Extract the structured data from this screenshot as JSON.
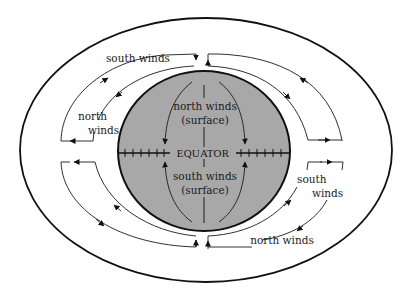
{
  "diagram": {
    "colors": {
      "earth_fill": "#a8a8a8",
      "stroke": "#111111",
      "background": "#ffffff"
    },
    "earth": {
      "equator_label": "EQUATOR",
      "north_surface": {
        "line1": "north winds",
        "line2": "(surface)"
      },
      "south_surface": {
        "line1": "south winds",
        "line2": "(surface)"
      }
    },
    "upper_winds": {
      "top_left": {
        "label": "south winds"
      },
      "left": {
        "line1": "north",
        "line2": "winds"
      },
      "right": {
        "line1": "south",
        "line2": "winds"
      },
      "bottom_right": {
        "label": "north winds"
      }
    },
    "icons": {
      "arrowhead": "arrow-icon"
    }
  }
}
